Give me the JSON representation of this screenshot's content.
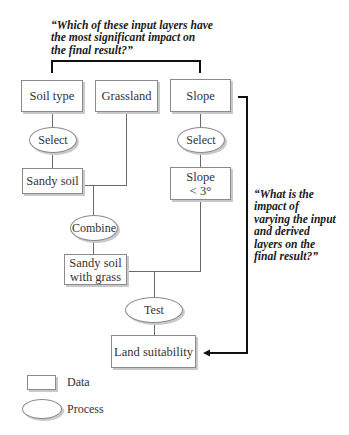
{
  "questions": {
    "top": "“Which of these input layers have\nthe most significant impact on\nthe final result?”",
    "right": "“What is the\nimpact of\nvarying the input\nand derived\nlayers on the\nfinal result?”"
  },
  "nodes": {
    "soil_type": "Soil type",
    "grassland": "Grassland",
    "slope": "Slope",
    "select_left": "Select",
    "select_right": "Select",
    "sandy_soil": "Sandy soil",
    "slope_lt3": "Slope\n< 3°",
    "combine": "Combine",
    "sandy_soil_grass": "Sandy soil\nwith grass",
    "test": "Test",
    "land_suitability": "Land suitability"
  },
  "legend": {
    "data": "Data",
    "process": "Process"
  }
}
